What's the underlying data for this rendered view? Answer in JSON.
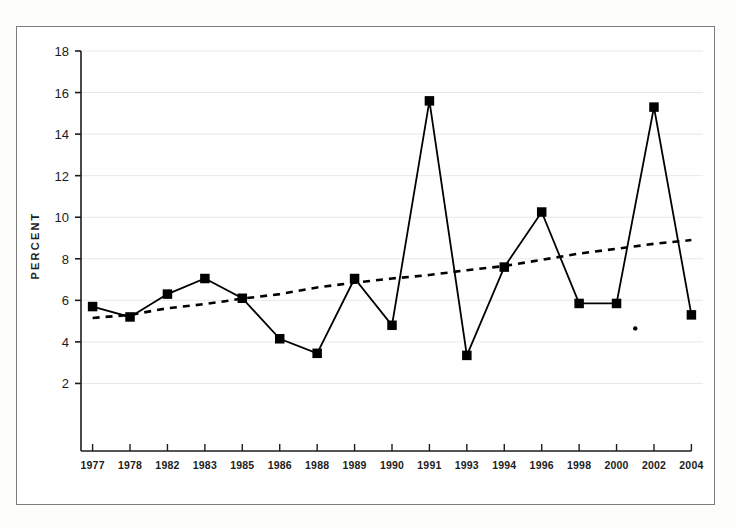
{
  "figure": {
    "background_color": "#ffffff",
    "border_color": "#7d7d7d"
  },
  "chart_data": {
    "type": "line",
    "title": "",
    "subtitle": "",
    "xlabel": "",
    "ylabel": "PERCENT",
    "categories": [
      "1977",
      "1978",
      "1982",
      "1983",
      "1985",
      "1986",
      "1988",
      "1989",
      "1990",
      "1991",
      "1993",
      "1994",
      "1996",
      "1998",
      "2000",
      "2002",
      "2004"
    ],
    "ylim": [
      0,
      18
    ],
    "yticks": [
      2,
      4,
      6,
      8,
      10,
      12,
      14,
      16,
      18
    ],
    "ytick_labels": [
      "2",
      "4",
      "6",
      "8",
      "10",
      "12",
      "14",
      "16",
      "18"
    ],
    "grid": true,
    "grid_axis": "y",
    "grid_color": "#e8e8e8",
    "legend": false,
    "legend_position": "none",
    "series": [
      {
        "name": "percent",
        "style": "solid",
        "marker": "square",
        "color": "#000000",
        "values": [
          5.7,
          5.2,
          6.3,
          7.05,
          6.1,
          4.15,
          3.45,
          7.05,
          4.8,
          15.6,
          3.35,
          7.6,
          10.25,
          5.85,
          5.85,
          15.3,
          5.3
        ]
      },
      {
        "name": "trend",
        "style": "dashed",
        "marker": "none",
        "color": "#000000",
        "values": [
          5.15,
          5.3,
          5.62,
          5.82,
          6.08,
          6.3,
          6.62,
          6.85,
          7.05,
          7.22,
          7.45,
          7.65,
          7.95,
          8.25,
          8.48,
          8.72,
          8.9
        ]
      }
    ],
    "annotations": [
      {
        "name": "stray-dot",
        "x_category": "2000",
        "x_offset_fraction": 0.5,
        "value": 4.65,
        "marker": "dot",
        "color": "#000000"
      }
    ]
  }
}
